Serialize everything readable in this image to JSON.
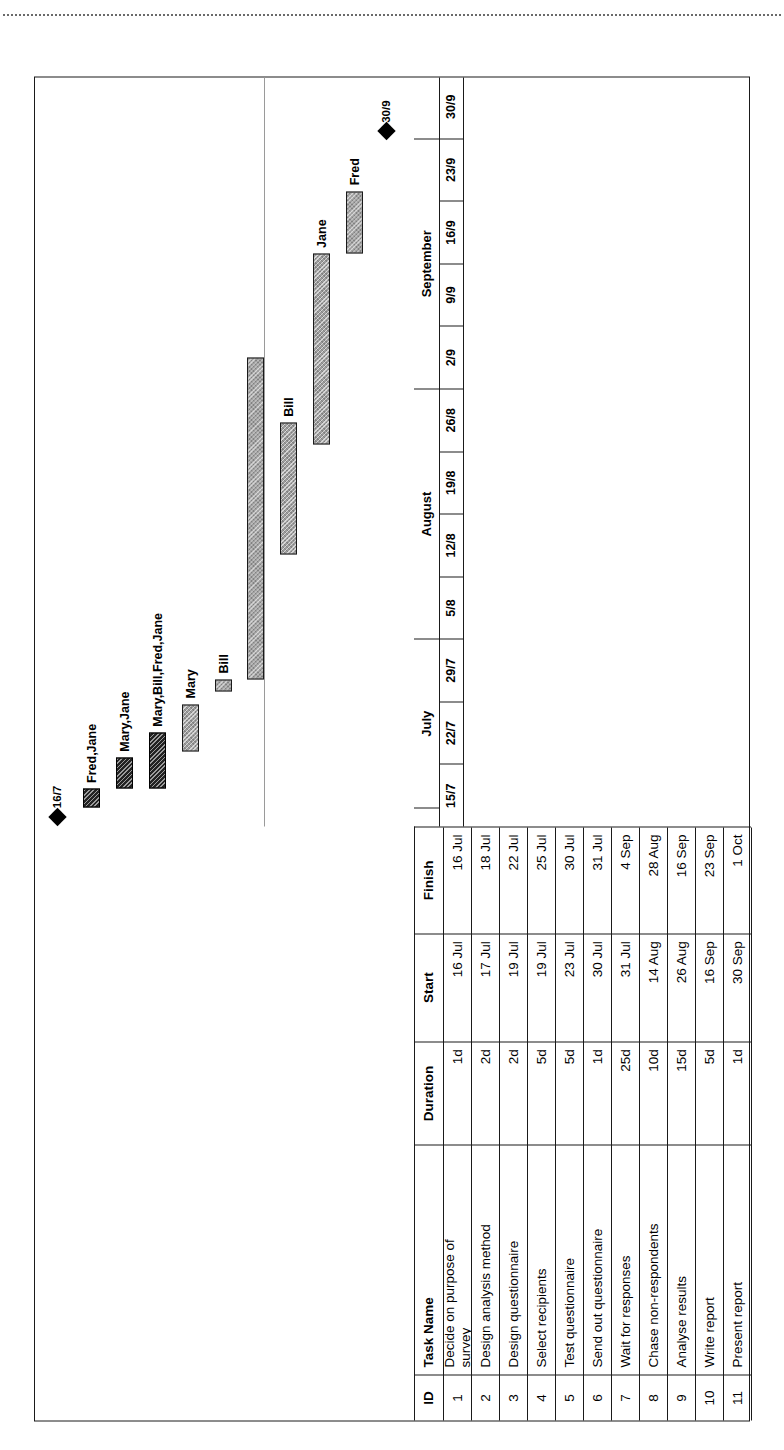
{
  "page": {
    "scan_top_text": "",
    "chart_title": ""
  },
  "table": {
    "columns": [
      "ID",
      "Task Name",
      "Duration",
      "Start",
      "Finish"
    ],
    "rows": [
      {
        "id": "1",
        "name": "Decide on purpose of\nsurvey",
        "duration": "1d",
        "start": "16 Jul",
        "finish": "16 Jul"
      },
      {
        "id": "2",
        "name": "Design analysis method",
        "duration": "2d",
        "start": "17 Jul",
        "finish": "18 Jul"
      },
      {
        "id": "3",
        "name": "Design questionnaire",
        "duration": "2d",
        "start": "19 Jul",
        "finish": "22 Jul"
      },
      {
        "id": "4",
        "name": "Select recipients",
        "duration": "5d",
        "start": "19 Jul",
        "finish": "25 Jul"
      },
      {
        "id": "5",
        "name": "Test questionnaire",
        "duration": "5d",
        "start": "23 Jul",
        "finish": "30 Jul"
      },
      {
        "id": "6",
        "name": "Send out questionnaire",
        "duration": "1d",
        "start": "30 Jul",
        "finish": "31 Jul"
      },
      {
        "id": "7",
        "name": "Wait for responses",
        "duration": "25d",
        "start": "31 Jul",
        "finish": "4 Sep"
      },
      {
        "id": "8",
        "name": "Chase non-respondents",
        "duration": "10d",
        "start": "14 Aug",
        "finish": "28 Aug"
      },
      {
        "id": "9",
        "name": "Analyse results",
        "duration": "15d",
        "start": "26 Aug",
        "finish": "16 Sep"
      },
      {
        "id": "10",
        "name": "Write report",
        "duration": "5d",
        "start": "16 Sep",
        "finish": "23 Sep"
      },
      {
        "id": "11",
        "name": "Present report",
        "duration": "1d",
        "start": "30 Sep",
        "finish": "1 Oct"
      }
    ]
  },
  "chart_data": {
    "type": "bar",
    "chart_kind": "gantt",
    "title": "",
    "xlabel": "",
    "ylabel": "",
    "grid": false,
    "legend": "none",
    "timeline": {
      "months": [
        {
          "label": "",
          "span_weeks": 0.3
        },
        {
          "label": "July",
          "span_weeks": 2.7
        },
        {
          "label": "August",
          "span_weeks": 4.0
        },
        {
          "label": "September",
          "span_weeks": 4.0
        },
        {
          "label": "",
          "span_weeks": 1.0
        }
      ],
      "weeks": [
        "15/7",
        "22/7",
        "29/7",
        "5/8",
        "12/8",
        "19/8",
        "26/8",
        "2/9",
        "9/9",
        "16/9",
        "23/9",
        "30/9"
      ]
    },
    "categories": [
      "Decide on purpose of survey",
      "Design analysis method",
      "Design questionnaire",
      "Select recipients",
      "Test questionnaire",
      "Send out questionnaire",
      "Wait for responses",
      "Chase non-respondents",
      "Analyse results",
      "Write report",
      "Present report"
    ],
    "bars": [
      {
        "id": "1",
        "kind": "milestone",
        "date": "16 Jul",
        "label": "16/7",
        "start_week": 0.15,
        "end_week": 0.15,
        "style": "milestone"
      },
      {
        "id": "2",
        "kind": "bar",
        "label": "Fred,Jane",
        "start_week": 0.3,
        "end_week": 0.6,
        "style": "critical"
      },
      {
        "id": "3",
        "kind": "bar",
        "label": "Mary,Jane",
        "start_week": 0.6,
        "end_week": 1.1,
        "style": "critical"
      },
      {
        "id": "4",
        "kind": "bar",
        "label": "Mary,Bill,Fred,Jane",
        "start_week": 0.6,
        "end_week": 1.5,
        "style": "critical"
      },
      {
        "id": "5",
        "kind": "bar",
        "label": "Mary",
        "start_week": 1.2,
        "end_week": 1.95,
        "style": "normal"
      },
      {
        "id": "6",
        "kind": "bar",
        "label": "Bill",
        "start_week": 2.15,
        "end_week": 2.35,
        "style": "normal"
      },
      {
        "id": "7",
        "kind": "bar",
        "label": "",
        "start_week": 2.35,
        "end_week": 7.5,
        "style": "normal"
      },
      {
        "id": "8",
        "kind": "bar",
        "label": "Bill",
        "start_week": 4.35,
        "end_week": 6.45,
        "style": "normal"
      },
      {
        "id": "9",
        "kind": "bar",
        "label": "Jane",
        "start_week": 6.1,
        "end_week": 9.15,
        "style": "normal"
      },
      {
        "id": "10",
        "kind": "bar",
        "label": "Fred",
        "start_week": 9.15,
        "end_week": 10.15,
        "style": "normal"
      },
      {
        "id": "11",
        "kind": "milestone",
        "date": "30 Sep",
        "label": "30/9",
        "start_week": 11.1,
        "end_week": 11.1,
        "style": "milestone"
      }
    ]
  }
}
